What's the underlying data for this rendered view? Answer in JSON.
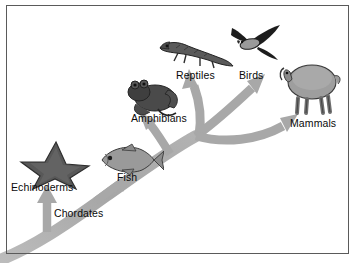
{
  "figure": {
    "background_color": "#ffffff",
    "border_color": "#5a5a5a",
    "arrow_color": "#a8a8a8",
    "label_color": "#0a0a0a"
  },
  "labels": {
    "echinoderms": "Echinoderms",
    "chordates": "Chordates",
    "fish": "Fish",
    "amphibians": "Amphibians",
    "reptiles": "Reptiles",
    "birds": "Birds",
    "mammals": "Mammals"
  },
  "organisms": [
    {
      "name": "starfish",
      "label": "Echinoderms"
    },
    {
      "name": "fish",
      "label": "Fish"
    },
    {
      "name": "frog",
      "label": "Amphibians"
    },
    {
      "name": "lizard",
      "label": "Reptiles"
    },
    {
      "name": "bird",
      "label": "Birds"
    },
    {
      "name": "sheep",
      "label": "Mammals"
    }
  ],
  "branches": [
    {
      "name": "trunk-chordates",
      "from": "origin",
      "to": "Chordates"
    },
    {
      "name": "branch-echinoderms",
      "from": "trunk",
      "to": "Echinoderms"
    },
    {
      "name": "branch-fish",
      "from": "trunk",
      "to": "Fish"
    },
    {
      "name": "branch-amphibians",
      "from": "trunk",
      "to": "Amphibians"
    },
    {
      "name": "branch-reptiles",
      "from": "junction",
      "to": "Reptiles"
    },
    {
      "name": "branch-birds",
      "from": "junction",
      "to": "Birds"
    },
    {
      "name": "branch-mammals",
      "from": "junction",
      "to": "Mammals"
    }
  ]
}
